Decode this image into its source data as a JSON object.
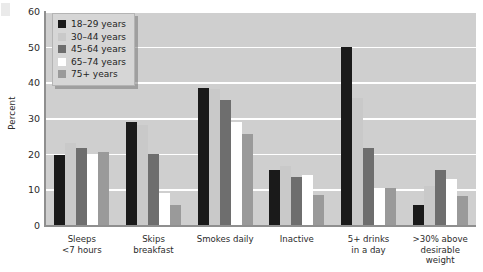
{
  "chart_data": {
    "type": "bar",
    "title": "",
    "xlabel": "",
    "ylabel": "Percent",
    "ylim": [
      0,
      60
    ],
    "yticks": [
      0,
      10,
      20,
      30,
      40,
      50,
      60
    ],
    "grid": true,
    "legend_position": "top-left",
    "categories": [
      "Sleeps\n<7 hours",
      "Skips\nbreakfast",
      "Smokes daily",
      "Inactive",
      "5+ drinks\nin a day",
      ">30% above\ndesirable\nweight"
    ],
    "category_lines": [
      [
        "Sleeps",
        "<7 hours"
      ],
      [
        "Skips",
        "breakfast"
      ],
      [
        "Smokes daily"
      ],
      [
        "Inactive"
      ],
      [
        "5+ drinks",
        "in a day"
      ],
      [
        ">30% above",
        "desirable",
        "weight"
      ]
    ],
    "series": [
      {
        "name": "18–29 years",
        "color": "#1a1a1a",
        "values": [
          19.5,
          29,
          38.5,
          15.5,
          50,
          5.5
        ]
      },
      {
        "name": "30–44 years",
        "color": "#c9c9c9",
        "values": [
          23,
          28,
          38,
          16.5,
          35.5,
          11
        ]
      },
      {
        "name": "45–64 years",
        "color": "#6e6e6e",
        "values": [
          21.5,
          20,
          35,
          13.5,
          21.5,
          15.5
        ]
      },
      {
        "name": "65–74 years",
        "color": "#ffffff",
        "values": [
          20,
          9,
          29,
          14,
          10.5,
          13
        ]
      },
      {
        "name": "75+ years",
        "color": "#9a9a9a",
        "values": [
          20.5,
          5.5,
          25.5,
          8.5,
          10.5,
          8
        ]
      }
    ]
  },
  "colors": {
    "plot_background": "#cfcfcf",
    "gridline": "#ffffff",
    "axis": "#8f8f8f",
    "legend_background": "#d6d6d6",
    "text": "#2b2b2b"
  }
}
